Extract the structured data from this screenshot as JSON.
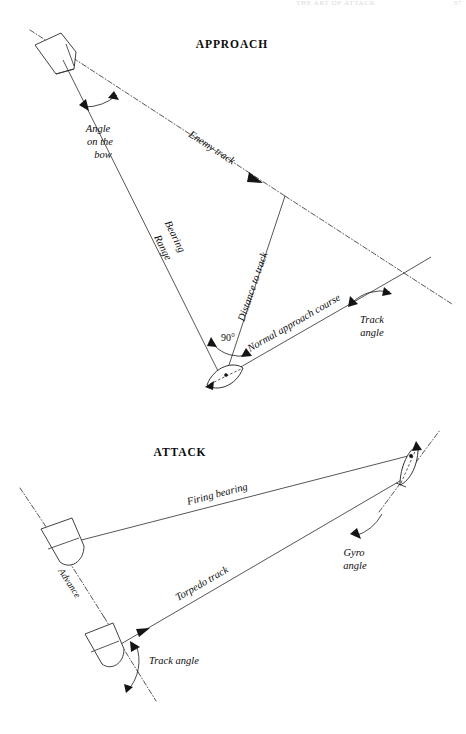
{
  "page": {
    "running_head": "THE ART OF ATTACK",
    "folio": "37",
    "background": "#ffffff",
    "ink": "#2b2b2b"
  },
  "figures": [
    {
      "id": "approach",
      "title": "APPROACH",
      "labels": {
        "angle_on_the_bow_l1": "Angle",
        "angle_on_the_bow_l2": "on the",
        "angle_on_the_bow_l3": "bow",
        "enemy_track": "Enemy track",
        "bearing": "Bearing",
        "range": "Range",
        "distance_to_track": "Distance to track",
        "normal_approach_course": "Normal approach course",
        "right_angle": "90°",
        "track_angle_l1": "Track",
        "track_angle_l2": "angle"
      },
      "vessels": [
        {
          "name": "enemy-ship",
          "type": "surface-ship"
        },
        {
          "name": "own-submarine",
          "type": "submarine"
        }
      ]
    },
    {
      "id": "attack",
      "title": "ATTACK",
      "labels": {
        "firing_bearing": "Firing bearing",
        "gyro_angle_l1": "Gyro",
        "gyro_angle_l2": "angle",
        "advance": "Advance",
        "torpedo_track": "Torpedo track",
        "track_angle": "Track angle"
      },
      "vessels": [
        {
          "name": "attacking-submarine",
          "type": "submarine"
        },
        {
          "name": "target-ship-firing-position",
          "type": "surface-ship"
        },
        {
          "name": "target-ship-intercept-position",
          "type": "surface-ship"
        }
      ]
    }
  ]
}
